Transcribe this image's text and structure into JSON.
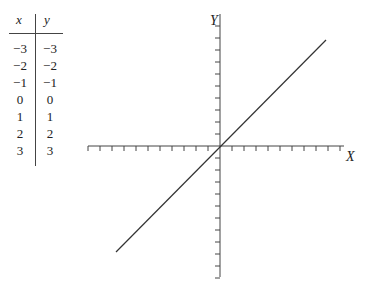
{
  "table": {
    "headers": [
      "x",
      "y"
    ],
    "rows": [
      [
        "−3",
        "−3"
      ],
      [
        "−2",
        "−2"
      ],
      [
        "−1",
        "−1"
      ],
      [
        "0",
        "0"
      ],
      [
        "1",
        "1"
      ],
      [
        "2",
        "2"
      ],
      [
        "3",
        "3"
      ]
    ]
  },
  "axes": {
    "x_label": "X",
    "y_label": "Y"
  },
  "chart_data": {
    "type": "line",
    "title": "",
    "xlabel": "X",
    "ylabel": "Y",
    "series": [
      {
        "name": "y = x",
        "x": [
          -3,
          -2,
          -1,
          0,
          1,
          2,
          3
        ],
        "y": [
          -3,
          -2,
          -1,
          0,
          1,
          2,
          3
        ]
      }
    ],
    "table": {
      "columns": [
        "x",
        "y"
      ],
      "rows": [
        [
          -3,
          -3
        ],
        [
          -2,
          -2
        ],
        [
          -1,
          -1
        ],
        [
          0,
          0
        ],
        [
          1,
          1
        ],
        [
          2,
          2
        ],
        [
          3,
          3
        ]
      ]
    },
    "xlim": [
      -11,
      10
    ],
    "ylim": [
      -11,
      10
    ],
    "x_ticks_count_negative": 11,
    "x_ticks_count_positive": 10,
    "y_ticks_count_positive": 10,
    "y_ticks_count_negative": 11,
    "grid": false,
    "line_extent": {
      "x": [
        -8.7,
        8.8
      ],
      "y": [
        -8.7,
        8.8
      ]
    }
  }
}
